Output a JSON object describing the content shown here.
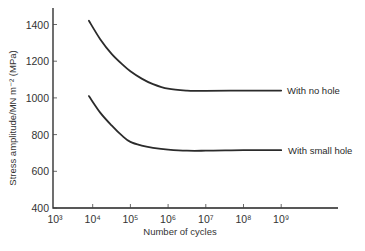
{
  "chart_data": {
    "type": "line",
    "title": "",
    "xlabel": "Number of cycles",
    "ylabel": "Stress amplitude/MN m⁻² (MPa)",
    "xscale": "log",
    "x_tick_labels": [
      "10³",
      "10⁴",
      "10⁵",
      "10⁶",
      "10⁷",
      "10⁸",
      "10⁹"
    ],
    "x_tick_exponents": [
      3,
      4,
      5,
      6,
      7,
      8,
      9
    ],
    "y_tick_labels": [
      "400",
      "600",
      "800",
      "1000",
      "1200",
      "1400"
    ],
    "y_ticks": [
      400,
      600,
      800,
      1000,
      1200,
      1400
    ],
    "xlim_log10": [
      3,
      10.5
    ],
    "ylim": [
      400,
      1480
    ],
    "grid": false,
    "legend_position": "inline labels at right end of curves",
    "series": [
      {
        "name": "With no hole",
        "x_log10": [
          3.9,
          4.2,
          4.5,
          4.8,
          5.0,
          5.3,
          5.6,
          6.0,
          6.5,
          7.0,
          8.0,
          9.0
        ],
        "values": [
          1420,
          1320,
          1240,
          1180,
          1145,
          1105,
          1075,
          1050,
          1040,
          1038,
          1040,
          1040
        ]
      },
      {
        "name": "With small hole",
        "x_log10": [
          3.9,
          4.2,
          4.5,
          4.8,
          5.0,
          5.3,
          5.6,
          6.0,
          6.5,
          7.0,
          8.0,
          9.0
        ],
        "values": [
          1010,
          920,
          850,
          790,
          760,
          740,
          728,
          718,
          712,
          712,
          715,
          715
        ]
      }
    ]
  },
  "labels": {
    "xlabel": "Number of cycles",
    "ylabel": "Stress amplitude/MN m⁻² (MPa)",
    "series_no_hole": "With no hole",
    "series_small_hole": "With small hole"
  }
}
